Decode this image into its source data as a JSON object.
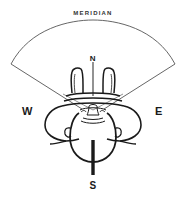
{
  "diagram": {
    "title": "MERIDIAN",
    "labels": {
      "meridian": "MERIDIAN",
      "north": "N",
      "south": "S",
      "west": "W",
      "east": "E"
    },
    "colors": {
      "stroke": "#1a1a1a",
      "thin_stroke": "#555555",
      "background": "#ffffff",
      "text": "#1a1a1a"
    },
    "elements": [
      "meridian-arc",
      "left-sight-line",
      "right-sight-line",
      "north-axis-line",
      "south-axis-line",
      "head-outline",
      "shoulders-outline",
      "arms-outline",
      "face-detail"
    ]
  }
}
